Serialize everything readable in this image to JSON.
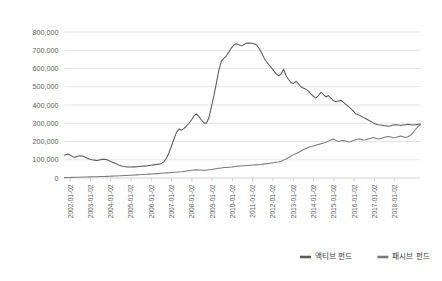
{
  "chart_data": {
    "type": "line",
    "title": "",
    "subtitle": "",
    "xlabel": "",
    "ylabel": "",
    "ylim": [
      0,
      800000
    ],
    "xlim": [
      "2002-01-02",
      "2018-07-02"
    ],
    "grid": true,
    "legend_position": "bottom-right",
    "ytick_labels": [
      "800,000",
      "700,000",
      "600,000",
      "500,000",
      "400,000",
      "300,000",
      "200,000",
      "100,000",
      "0"
    ],
    "ytick_values": [
      800000,
      700000,
      600000,
      500000,
      400000,
      300000,
      200000,
      100000,
      0
    ],
    "xtick_labels": [
      "2002-01-02",
      "2003-01-02",
      "2004-01-02",
      "2005-01-02",
      "2006-01-02",
      "2007-01-02",
      "2008-01-02",
      "2009-01-02",
      "2010-01-02",
      "2011-01-02",
      "2012-01-02",
      "2013-01-02",
      "2014-01-02",
      "2015-01-02",
      "2016-01-02",
      "2017-01-02",
      "2018-01-02"
    ],
    "series": [
      {
        "name": "액티브 펀드",
        "color": "#595959",
        "values": [
          125000,
          130000,
          128000,
          120000,
          112000,
          118000,
          122000,
          120000,
          116000,
          110000,
          104000,
          100000,
          98000,
          96000,
          99000,
          102000,
          103000,
          100000,
          94000,
          88000,
          82000,
          76000,
          70000,
          66000,
          63000,
          61000,
          60000,
          60000,
          61000,
          62000,
          63000,
          64000,
          65000,
          66000,
          68000,
          70000,
          72000,
          74000,
          76000,
          80000,
          90000,
          110000,
          140000,
          175000,
          215000,
          250000,
          268000,
          262000,
          272000,
          286000,
          300000,
          318000,
          340000,
          352000,
          336000,
          318000,
          302000,
          300000,
          330000,
          390000,
          450000,
          520000,
          590000,
          640000,
          655000,
          668000,
          690000,
          712000,
          728000,
          736000,
          730000,
          724000,
          730000,
          738000,
          740000,
          738000,
          736000,
          730000,
          714000,
          690000,
          662000,
          640000,
          622000,
          606000,
          588000,
          572000,
          560000,
          570000,
          596000,
          560000,
          540000,
          522000,
          518000,
          530000,
          516000,
          500000,
          492000,
          486000,
          476000,
          460000,
          448000,
          438000,
          452000,
          470000,
          458000,
          444000,
          452000,
          438000,
          424000,
          418000,
          422000,
          426000,
          416000,
          404000,
          392000,
          380000,
          366000,
          352000,
          346000,
          340000,
          332000,
          326000,
          318000,
          310000,
          302000,
          296000,
          292000,
          290000,
          288000,
          286000,
          284000,
          286000,
          290000,
          292000,
          290000,
          288000,
          290000,
          292000,
          294000,
          292000,
          290000,
          292000,
          294000,
          296000
        ]
      },
      {
        "name": "패시브 펀드",
        "color": "#7a7a7a",
        "values": [
          2000,
          2500,
          3000,
          3400,
          3800,
          4200,
          4600,
          5000,
          5400,
          5800,
          6200,
          6600,
          7000,
          7400,
          7800,
          8200,
          8600,
          9000,
          9600,
          10200,
          10800,
          11400,
          12000,
          12600,
          13200,
          14000,
          14800,
          15600,
          16400,
          17200,
          18000,
          18800,
          19600,
          20400,
          21200,
          22000,
          23000,
          24000,
          25000,
          26000,
          27000,
          28000,
          29000,
          30000,
          31000,
          32000,
          33000,
          34000,
          36000,
          38000,
          40000,
          42000,
          44000,
          45000,
          44000,
          43000,
          42000,
          43000,
          45000,
          47000,
          49000,
          51000,
          53000,
          55000,
          57000,
          58000,
          59000,
          60000,
          62000,
          64000,
          65000,
          66000,
          67000,
          68000,
          69000,
          70000,
          71000,
          72000,
          73000,
          74000,
          76000,
          78000,
          80000,
          82000,
          84000,
          86000,
          88000,
          92000,
          98000,
          104000,
          112000,
          120000,
          128000,
          134000,
          140000,
          148000,
          156000,
          162000,
          168000,
          172000,
          176000,
          180000,
          184000,
          188000,
          192000,
          196000,
          202000,
          208000,
          214000,
          206000,
          200000,
          204000,
          206000,
          202000,
          198000,
          200000,
          206000,
          210000,
          214000,
          212000,
          208000,
          210000,
          214000,
          218000,
          222000,
          218000,
          214000,
          216000,
          220000,
          224000,
          228000,
          224000,
          220000,
          222000,
          226000,
          230000,
          226000,
          222000,
          226000,
          234000,
          248000,
          266000,
          282000,
          292000
        ]
      }
    ]
  },
  "legend": {
    "items": [
      {
        "label": "액티브 펀드",
        "color": "#595959"
      },
      {
        "label": "패시브 펀드",
        "color": "#7a7a7a"
      }
    ]
  }
}
